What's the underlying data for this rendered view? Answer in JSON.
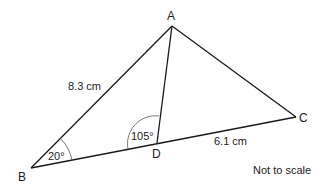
{
  "diagram": {
    "type": "triangle",
    "vertices": {
      "A": {
        "label": "A",
        "x": 172,
        "y": 26
      },
      "B": {
        "label": "B",
        "x": 31,
        "y": 168
      },
      "C": {
        "label": "C",
        "x": 296,
        "y": 117
      },
      "D": {
        "label": "D",
        "x": 157,
        "y": 143
      }
    },
    "segments": [
      {
        "from": "A",
        "to": "B",
        "label": "8.3 cm"
      },
      {
        "from": "A",
        "to": "C",
        "label": ""
      },
      {
        "from": "B",
        "to": "C",
        "label": ""
      },
      {
        "from": "A",
        "to": "D",
        "label": ""
      },
      {
        "from": "D",
        "to": "C",
        "label": "6.1 cm"
      }
    ],
    "angles": [
      {
        "at": "B",
        "label": "20°"
      },
      {
        "at": "D",
        "label": "105°"
      }
    ],
    "note": "Not to scale",
    "line_color": "#1a1a1a"
  }
}
